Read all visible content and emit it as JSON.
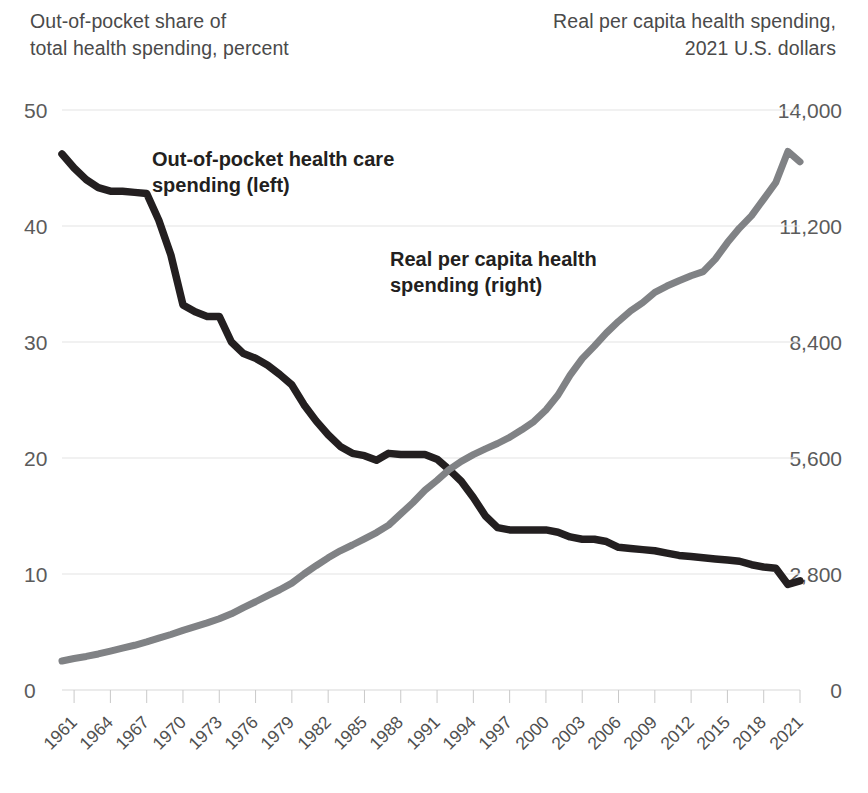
{
  "axes": {
    "left_title": "Out-of-pocket share of\ntotal health spending, percent",
    "right_title": "Real per capita health spending,\n2021 U.S. dollars",
    "left_ticks": [
      "50",
      "40",
      "30",
      "20",
      "10",
      "0"
    ],
    "right_ticks": [
      "14,000",
      "11,200",
      "8,400",
      "5,600",
      "2,800",
      "0"
    ],
    "x_ticks": [
      "1961",
      "1964",
      "1967",
      "1970",
      "1973",
      "1976",
      "1979",
      "1982",
      "1985",
      "1988",
      "1991",
      "1994",
      "1997",
      "2000",
      "2003",
      "2006",
      "2009",
      "2012",
      "2015",
      "2018",
      "2021"
    ]
  },
  "labels": {
    "out_of_pocket": "Out-of-pocket health care\nspending (left)",
    "real_per_capita": "Real per capita health\nspending (right)"
  },
  "colors": {
    "out_of_pocket_line": "#231f20",
    "real_per_capita_line": "#808285",
    "gridline": "#e3e3e3",
    "axis_text": "#4f4f4f"
  },
  "chart_data": {
    "type": "line",
    "title": "",
    "subtitle": "",
    "xlabel": "",
    "ylabel": "Out-of-pocket share of total health spending, percent",
    "y2label": "Real per capita health spending, 2021 U.S. dollars",
    "grid": true,
    "legend": "in-chart annotations",
    "xlim": [
      1960,
      2021
    ],
    "ylim": [
      0,
      50
    ],
    "y2lim": [
      0,
      14000
    ],
    "x": [
      1960,
      1961,
      1962,
      1963,
      1964,
      1965,
      1966,
      1967,
      1968,
      1969,
      1970,
      1971,
      1972,
      1973,
      1974,
      1975,
      1976,
      1977,
      1978,
      1979,
      1980,
      1981,
      1982,
      1983,
      1984,
      1985,
      1986,
      1987,
      1988,
      1989,
      1990,
      1991,
      1992,
      1993,
      1994,
      1995,
      1996,
      1997,
      1998,
      1999,
      2000,
      2001,
      2002,
      2003,
      2004,
      2005,
      2006,
      2007,
      2008,
      2009,
      2010,
      2011,
      2012,
      2013,
      2014,
      2015,
      2016,
      2017,
      2018,
      2019,
      2020,
      2021
    ],
    "series": [
      {
        "name": "Out-of-pocket health care spending (left)",
        "axis": "left",
        "unit": "percent",
        "color": "#231f20",
        "values": [
          46.2,
          45.0,
          44.0,
          43.3,
          43.0,
          43.0,
          42.9,
          42.8,
          40.5,
          37.5,
          33.2,
          32.6,
          32.2,
          32.2,
          30.0,
          29.0,
          28.6,
          28.0,
          27.2,
          26.3,
          24.6,
          23.2,
          22.0,
          21.0,
          20.4,
          20.2,
          19.8,
          20.4,
          20.3,
          20.3,
          20.3,
          19.9,
          19.0,
          18.0,
          16.6,
          15.0,
          14.0,
          13.8,
          13.8,
          13.8,
          13.8,
          13.6,
          13.2,
          13.0,
          13.0,
          12.8,
          12.3,
          12.2,
          12.1,
          12.0,
          11.8,
          11.6,
          11.5,
          11.4,
          11.3,
          11.2,
          11.1,
          10.8,
          10.6,
          10.5,
          9.1,
          9.4
        ]
      },
      {
        "name": "Real per capita health spending (right)",
        "axis": "right",
        "unit": "2021 U.S. dollars",
        "color": "#808285",
        "values": [
          700,
          760,
          810,
          870,
          940,
          1010,
          1080,
          1160,
          1250,
          1340,
          1440,
          1530,
          1620,
          1720,
          1840,
          1990,
          2130,
          2280,
          2420,
          2580,
          2800,
          3000,
          3190,
          3360,
          3500,
          3650,
          3800,
          3980,
          4250,
          4520,
          4820,
          5060,
          5320,
          5520,
          5680,
          5820,
          5950,
          6100,
          6280,
          6480,
          6760,
          7120,
          7600,
          8000,
          8300,
          8620,
          8900,
          9150,
          9350,
          9600,
          9750,
          9880,
          10000,
          10100,
          10400,
          10800,
          11150,
          11450,
          11850,
          12250,
          13000,
          12750
        ]
      }
    ],
    "annotations": [
      {
        "text": "Out-of-pocket health care spending (left)",
        "series": "out_of_pocket"
      },
      {
        "text": "Real per capita health spending (right)",
        "series": "real_per_capita"
      }
    ]
  }
}
